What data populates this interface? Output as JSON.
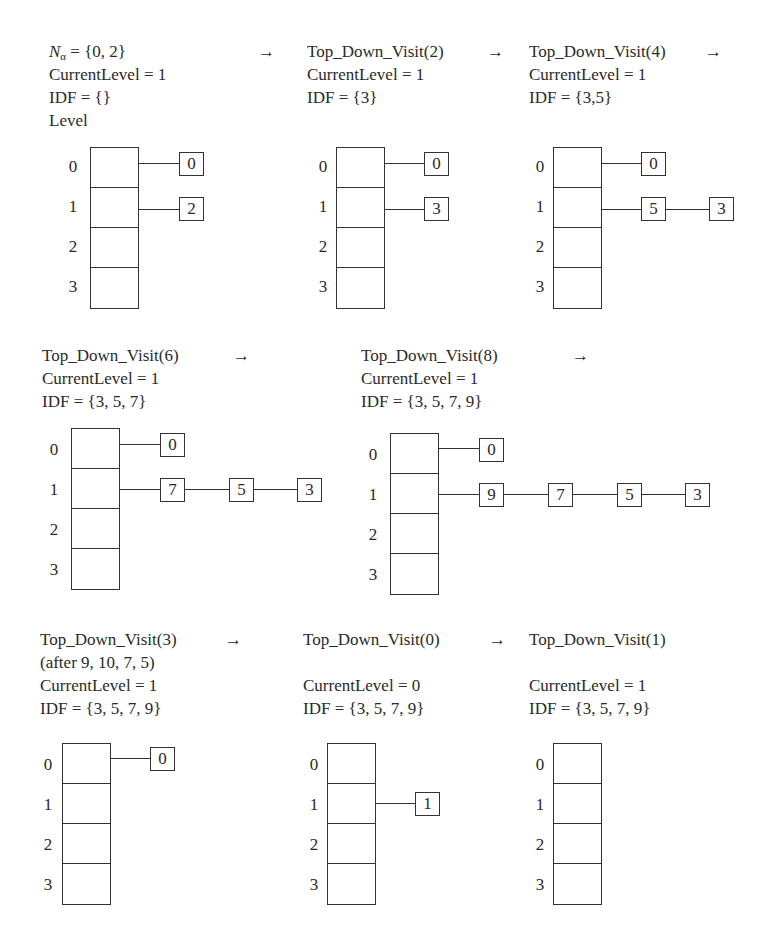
{
  "figure": {
    "level_label": "Level",
    "level_indices": [
      "0",
      "1",
      "2",
      "3"
    ],
    "arrow": "→",
    "panels": [
      {
        "id": "initial",
        "title_prefix": "N",
        "title_sub": "α",
        "title_suffix": " = {0, 2}",
        "current_level": "CurrentLevel = 1",
        "idf": "IDF = {}",
        "lists": {
          "0": [
            "0"
          ],
          "1": [
            "2"
          ],
          "2": [],
          "3": []
        }
      },
      {
        "id": "visit-2",
        "title": "Top_Down_Visit(2)",
        "current_level": "CurrentLevel = 1",
        "idf": "IDF = {3}",
        "lists": {
          "0": [
            "0"
          ],
          "1": [
            "3"
          ],
          "2": [],
          "3": []
        }
      },
      {
        "id": "visit-4",
        "title": "Top_Down_Visit(4)",
        "current_level": "CurrentLevel = 1",
        "idf": "IDF = {3,5}",
        "lists": {
          "0": [
            "0"
          ],
          "1": [
            "5",
            "3"
          ],
          "2": [],
          "3": []
        }
      },
      {
        "id": "visit-6",
        "title": "Top_Down_Visit(6)",
        "current_level": "CurrentLevel = 1",
        "idf": "IDF = {3, 5, 7}",
        "lists": {
          "0": [
            "0"
          ],
          "1": [
            "7",
            "5",
            "3"
          ],
          "2": [],
          "3": []
        }
      },
      {
        "id": "visit-8",
        "title": "Top_Down_Visit(8)",
        "current_level": "CurrentLevel = 1",
        "idf": "IDF = {3, 5, 7, 9}",
        "lists": {
          "0": [
            "0"
          ],
          "1": [
            "9",
            "7",
            "5",
            "3"
          ],
          "2": [],
          "3": []
        }
      },
      {
        "id": "visit-3",
        "title": "Top_Down_Visit(3)",
        "note": "(after 9, 10, 7, 5)",
        "current_level": "CurrentLevel = 1",
        "idf": "IDF = {3, 5, 7, 9}",
        "lists": {
          "0": [
            "0"
          ],
          "1": [],
          "2": [],
          "3": []
        }
      },
      {
        "id": "visit-0",
        "title": "Top_Down_Visit(0)",
        "current_level": "CurrentLevel = 0",
        "idf": "IDF = {3, 5, 7, 9}",
        "lists": {
          "0": [],
          "1": [
            "1"
          ],
          "2": [],
          "3": []
        }
      },
      {
        "id": "visit-1",
        "title": "Top_Down_Visit(1)",
        "current_level": "CurrentLevel = 1",
        "idf": "IDF = {3, 5, 7, 9}",
        "lists": {
          "0": [],
          "1": [],
          "2": [],
          "3": []
        }
      }
    ]
  }
}
